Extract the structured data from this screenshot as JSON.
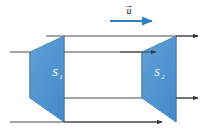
{
  "figure": {
    "background_color": "#ffffff",
    "width": 207,
    "height": 132,
    "colors": {
      "surface_fill": "#4a90d0",
      "surface_fill_light": "#5b9ed8",
      "surface_stroke": "#3a7cba",
      "line_stroke": "#4a4a4a",
      "vector_arrow": "#2f7fc1",
      "label_text": "#ffffff",
      "vector_text": "#1a1a1a"
    },
    "velocity_vector": {
      "symbol": "u",
      "accent": "→",
      "label": "u-vector",
      "arrow_direction": "right"
    },
    "surfaces": [
      {
        "id": "S1",
        "symbol": "S",
        "subscript": "1",
        "label": "S₁",
        "position": "left",
        "points": "64,36 64,122 30,98 30,52"
      },
      {
        "id": "S2",
        "symbol": "S",
        "subscript": "2",
        "label": "S₂",
        "position": "right",
        "points": "176,36 176,122 142,98 142,52"
      }
    ],
    "flow_lines": [
      {
        "name": "top-edge-line",
        "y": 36,
        "arrow": true
      },
      {
        "name": "upper-middle-line",
        "y": 52,
        "arrow": true
      },
      {
        "name": "lower-middle-line",
        "y": 98,
        "arrow": true
      },
      {
        "name": "bottom-edge-line",
        "y": 122,
        "arrow": true
      }
    ]
  }
}
